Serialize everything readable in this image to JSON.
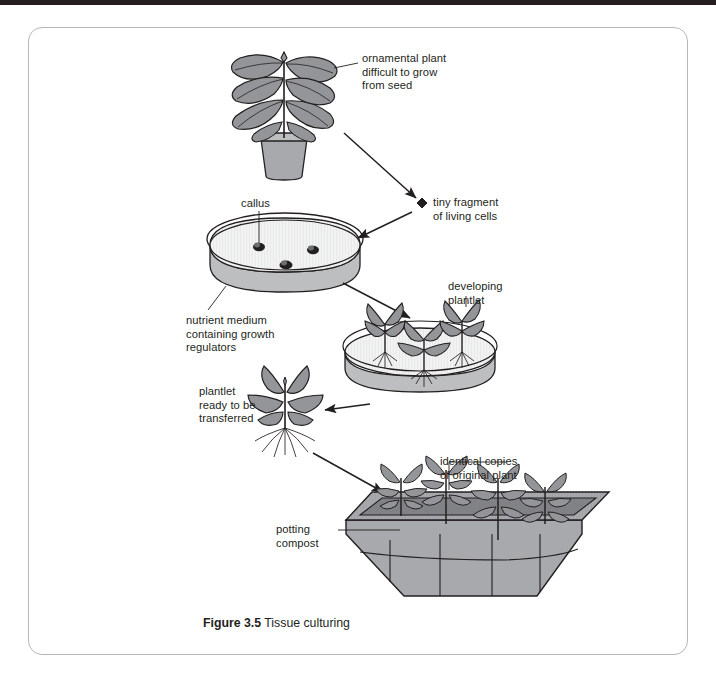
{
  "figure": {
    "number_label": "Figure 3.5",
    "title": "Tissue culturing"
  },
  "colors": {
    "outline": "#231f20",
    "leaf_fill": "#939598",
    "pot_fill": "#a7a9ac",
    "dish_top": "#f1f2f2",
    "dish_side": "#bcbec0",
    "tray_fill": "#a7a9ac",
    "tray_dark": "#808285",
    "border": "#b7b7b7",
    "text": "#231f20"
  },
  "labels": {
    "ornamental_plant": "ornamental plant\ndifficult to grow\nfrom seed",
    "tiny_fragment": "tiny fragment\nof living cells",
    "callus": "callus",
    "nutrient_medium": "nutrient medium\ncontaining growth\nregulators",
    "developing_plantlet": "developing\nplantlet",
    "plantlet_ready": "plantlet\nready to be\ntransferred",
    "identical_copies": "identical copies\nof original plant",
    "potting_compost": "potting\ncompost"
  },
  "stages": [
    {
      "name": "ornamental-plant-in-pot",
      "order": 1
    },
    {
      "name": "tiny-fragment-of-cells",
      "order": 2
    },
    {
      "name": "petri-dish-with-callus",
      "order": 3
    },
    {
      "name": "petri-dish-with-plantlets",
      "order": 4
    },
    {
      "name": "single-plantlet",
      "order": 5
    },
    {
      "name": "seed-tray-with-plants",
      "order": 6
    }
  ]
}
